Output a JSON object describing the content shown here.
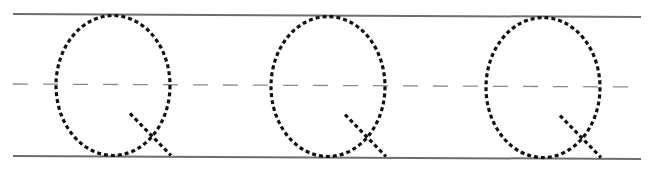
{
  "worksheet": {
    "type": "handwriting tracing practice",
    "letter": "Q",
    "repetitions": 3,
    "guides": [
      "top line (solid)",
      "midline (dashed)",
      "baseline (solid)"
    ],
    "colors": {
      "guide_line": "#6e6e6e",
      "midline": "#8a8a8a",
      "trace_stroke": "#111111",
      "background": "#ffffff"
    }
  }
}
